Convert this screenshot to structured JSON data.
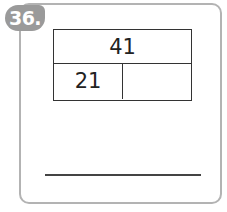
{
  "problem": {
    "number": "36.",
    "whole": "41",
    "part_known": "21",
    "part_unknown": ""
  },
  "colors": {
    "badge": "#9a9a9a",
    "card_border": "#b3b3b3",
    "lines": "#333333"
  }
}
